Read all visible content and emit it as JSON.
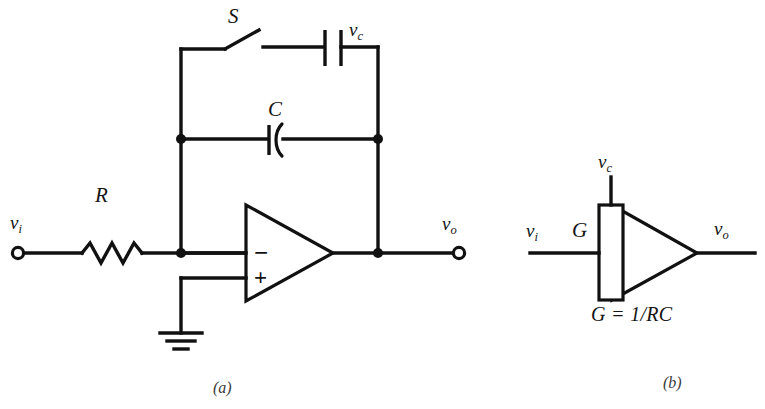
{
  "figure": {
    "background_color": "#ffffff",
    "line_color": "#111111"
  },
  "panel_a": {
    "caption": "(a)",
    "labels": {
      "input_terminal": "v",
      "input_terminal_sub": "i",
      "output_terminal": "v",
      "output_terminal_sub": "o",
      "resistor": "R",
      "capacitor": "C",
      "switch": "S",
      "reset_source": "v",
      "reset_source_sub": "c"
    },
    "components": [
      {
        "name": "input-terminal",
        "type": "open-terminal",
        "label": "v_i"
      },
      {
        "name": "resistor-r",
        "type": "resistor",
        "label": "R"
      },
      {
        "name": "feedback-capacitor-c",
        "type": "capacitor",
        "label": "C"
      },
      {
        "name": "reset-switch-s",
        "type": "switch",
        "label": "S",
        "state": "open"
      },
      {
        "name": "reset-voltage-source",
        "type": "capacitor-source",
        "label": "v_c"
      },
      {
        "name": "operational-amplifier",
        "type": "opamp",
        "inverting_sign": "−",
        "noninverting_sign": "+"
      },
      {
        "name": "ground-symbol",
        "type": "ground"
      },
      {
        "name": "output-terminal",
        "type": "open-terminal",
        "label": "v_o"
      }
    ]
  },
  "panel_b": {
    "caption": "(b)",
    "labels": {
      "input": "v",
      "input_sub": "i",
      "output": "v",
      "output_sub": "o",
      "control": "v",
      "control_sub": "c",
      "gain": "G",
      "gain_equation": "G = 1/RC"
    },
    "components": [
      {
        "name": "integrator-block",
        "type": "triangle-with-box",
        "gain_label": "G"
      },
      {
        "name": "input-line",
        "type": "wire",
        "label": "v_i"
      },
      {
        "name": "output-line",
        "type": "wire",
        "label": "v_o"
      },
      {
        "name": "control-line",
        "type": "wire",
        "label": "v_c"
      }
    ]
  }
}
